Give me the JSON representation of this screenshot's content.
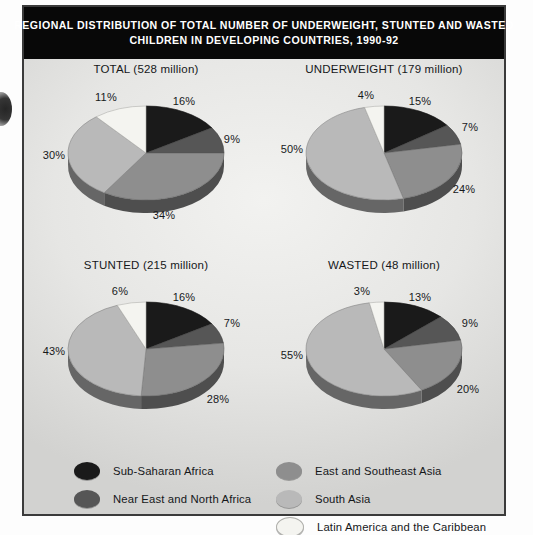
{
  "title": {
    "line1": "REGIONAL DISTRIBUTION OF TOTAL NUMBER OF UNDERWEIGHT, STUNTED AND WASTED",
    "line2": "CHILDREN IN DEVELOPING COUNTRIES, 1990-92"
  },
  "colors": {
    "sub_saharan_africa": "#1a1a1a",
    "near_east_north_africa": "#565656",
    "east_southeast_asia": "#8e8e8e",
    "south_asia": "#b9b9b9",
    "latin_america_caribbean": "#f4f4f0",
    "frame": "#3b3b3b",
    "title_bar": "#080808",
    "panel_background": "#e6e6e4",
    "text": "#16181a"
  },
  "legend": {
    "left_column": [
      {
        "label": "Sub-Saharan Africa",
        "color": "#1a1a1a"
      },
      {
        "label": "Near East and North Africa",
        "color": "#565656"
      }
    ],
    "right_column": [
      {
        "label": "East and Southeast Asia",
        "color": "#8e8e8e"
      },
      {
        "label": "South Asia",
        "color": "#b9b9b9"
      },
      {
        "label": "Latin America and the Caribbean",
        "color": "#f4f4f0"
      }
    ]
  },
  "chart_data": {
    "type": "pie",
    "title": "REGIONAL DISTRIBUTION OF TOTAL NUMBER OF UNDERWEIGHT, STUNTED AND WASTED CHILDREN IN DEVELOPING COUNTRIES, 1990-92",
    "units": "percent of regional share",
    "categories": [
      "Sub-Saharan Africa",
      "Near East and North Africa",
      "East and Southeast Asia",
      "South Asia",
      "Latin America and the Caribbean"
    ],
    "legend_position": "bottom",
    "charts": [
      {
        "name": "TOTAL",
        "title": "TOTAL (528 million)",
        "total_millions": 528,
        "values": [
          16,
          9,
          34,
          30,
          11
        ],
        "labels": [
          "16%",
          "9%",
          "34%",
          "30%",
          "11%"
        ]
      },
      {
        "name": "UNDERWEIGHT",
        "title": "UNDERWEIGHT (179 million)",
        "total_millions": 179,
        "values": [
          15,
          7,
          24,
          50,
          4
        ],
        "labels": [
          "15%",
          "7%",
          "24%",
          "50%",
          "4%"
        ]
      },
      {
        "name": "STUNTED",
        "title": "STUNTED (215 million)",
        "total_millions": 215,
        "values": [
          16,
          7,
          28,
          43,
          6
        ],
        "labels": [
          "16%",
          "7%",
          "28%",
          "43%",
          "6%"
        ]
      },
      {
        "name": "WASTED",
        "title": "WASTED (48 million)",
        "total_millions": 48,
        "values": [
          13,
          9,
          20,
          55,
          3
        ],
        "labels": [
          "13%",
          "9%",
          "20%",
          "55%",
          "3%"
        ]
      }
    ]
  }
}
